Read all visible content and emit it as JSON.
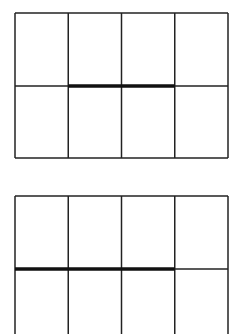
{
  "page": {
    "background_color": "#ffffff",
    "width": 243,
    "height": 334
  },
  "style": {
    "line_color": "#222222",
    "bold_line_color": "#111111",
    "thin_stroke_width": 1.5,
    "bold_stroke_width": 3.4
  },
  "figures": [
    {
      "id": "figure-top",
      "name": "top-grid-diagram",
      "label": "Top grid: 4 columns by 2 rows, bold divider over columns 2 and 3",
      "x": 15,
      "y": 13,
      "width": 213,
      "height": 145,
      "columns": 4,
      "rows": 2,
      "clipped_bottom": false,
      "column_x": [
        15,
        68.25,
        121.5,
        174.75,
        228
      ],
      "divider_y": 86,
      "bold_span": {
        "from_x": 68.25,
        "to_x": 174.75,
        "columns": [
          2,
          3
        ]
      }
    },
    {
      "id": "figure-bottom",
      "name": "bottom-grid-diagram",
      "label": "Bottom grid: 4 columns by 2 rows, bold divider over columns 1, 2 and 3, clipped at image edge",
      "x": 15,
      "y": 196,
      "width": 213,
      "height": 138,
      "columns": 4,
      "rows": 2,
      "clipped_bottom": true,
      "column_x": [
        15,
        68.25,
        121.5,
        174.75,
        228
      ],
      "divider_y": 269,
      "bold_span": {
        "from_x": 15,
        "to_x": 174.75,
        "columns": [
          1,
          2,
          3
        ]
      }
    }
  ]
}
